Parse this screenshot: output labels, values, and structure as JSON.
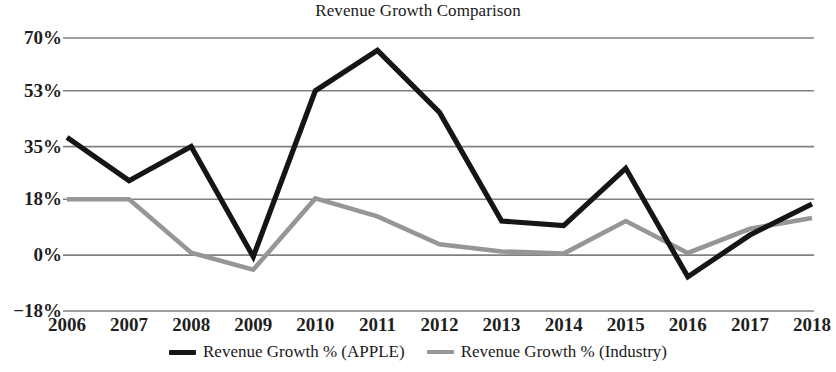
{
  "chart_data": {
    "type": "line",
    "title": "Revenue Growth Comparison",
    "xlabel": "",
    "ylabel": "",
    "categories": [
      "2006",
      "2007",
      "2008",
      "2009",
      "2010",
      "2011",
      "2012",
      "2013",
      "2014",
      "2015",
      "2016",
      "2017",
      "2018"
    ],
    "x": [
      2006,
      2007,
      2008,
      2009,
      2010,
      2011,
      2012,
      2013,
      2014,
      2015,
      2016,
      2017,
      2018
    ],
    "series": [
      {
        "name": "Revenue Growth % (APPLE)",
        "color": "#151515",
        "values": [
          38,
          24,
          35,
          -0.5,
          53,
          66,
          46,
          11,
          9.5,
          28,
          -7,
          6.5,
          16.5
        ]
      },
      {
        "name": "Revenue Growth % (Industry)",
        "color": "#969696",
        "values": [
          18,
          18,
          0.8,
          -4.7,
          18.3,
          12.5,
          3.5,
          1.2,
          0.5,
          11,
          0.7,
          8.5,
          12
        ]
      }
    ],
    "ylim": [
      -18,
      70
    ],
    "ytick_values": [
      70,
      53,
      35,
      18,
      0,
      -18
    ],
    "ytick_labels": [
      "70%",
      "53%",
      "35%",
      "18%",
      "0%",
      "−18%"
    ],
    "grid": true,
    "gridline_color": "#808080",
    "legend_position": "bottom"
  },
  "legend": {
    "entries": [
      {
        "label": "Revenue Growth % (APPLE)",
        "color": "#151515"
      },
      {
        "label": "Revenue Growth % (Industry)",
        "color": "#969696"
      }
    ]
  }
}
